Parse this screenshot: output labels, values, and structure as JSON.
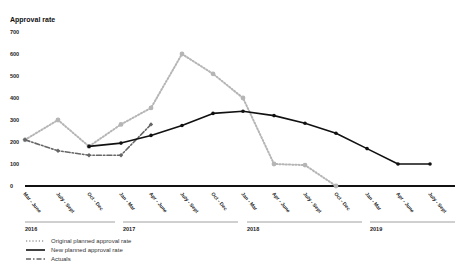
{
  "chart_data": {
    "type": "line",
    "title": "",
    "ylabel": "Approval rate",
    "xlabel": "",
    "ylim": [
      0,
      700
    ],
    "yticks": [
      0,
      100,
      200,
      300,
      400,
      500,
      600,
      700
    ],
    "grid": false,
    "legend_position": "bottom-left",
    "categories": [
      "Mar - June",
      "July - Sept",
      "Oct - Dec",
      "Jan - Mar",
      "Apr - June",
      "July - Sept",
      "Oct - Dec",
      "Jan - Mar",
      "Apr - June",
      "July - Sept",
      "Oct - Dec",
      "Jan - Mar",
      "Apr - June",
      "July - Sept"
    ],
    "year_groups": [
      {
        "label": "2016",
        "start": 0,
        "end": 2
      },
      {
        "label": "2017",
        "start": 3,
        "end": 6
      },
      {
        "label": "2018",
        "start": 7,
        "end": 10
      },
      {
        "label": "2019",
        "start": 11,
        "end": 13
      }
    ],
    "series": [
      {
        "name": "Original planned approval rate",
        "style": "dotted",
        "color": "#b5b5b5",
        "values": [
          210,
          300,
          180,
          280,
          355,
          600,
          510,
          400,
          100,
          95,
          0,
          null,
          null,
          null
        ]
      },
      {
        "name": "New planned approval rate",
        "style": "solid",
        "color": "#111111",
        "values": [
          null,
          null,
          180,
          195,
          230,
          275,
          330,
          340,
          320,
          285,
          240,
          170,
          100,
          100
        ]
      },
      {
        "name": "Actuals",
        "style": "dash-dot",
        "color": "#666666",
        "values": [
          210,
          160,
          140,
          140,
          280,
          null,
          null,
          null,
          null,
          null,
          null,
          null,
          null,
          null
        ]
      }
    ]
  },
  "legend": {
    "items": [
      {
        "label": "Original planned approval rate",
        "style": "dotted"
      },
      {
        "label": "New planned approval rate",
        "style": "solid"
      },
      {
        "label": "Actuals",
        "style": "dash-dot"
      }
    ]
  }
}
